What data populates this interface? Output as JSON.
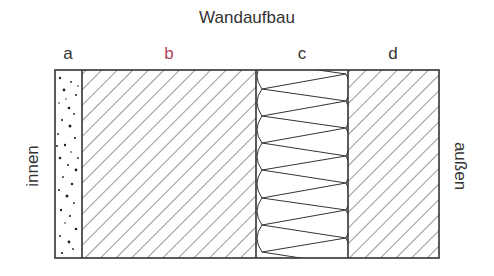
{
  "diagram": {
    "title": "Wandaufbau",
    "layers": [
      {
        "id": "a",
        "label": "a",
        "pattern": "stipple",
        "color": "#333333"
      },
      {
        "id": "b",
        "label": "b",
        "pattern": "diagonal-hatch",
        "color": "#b0485a"
      },
      {
        "id": "c",
        "label": "c",
        "pattern": "insulation-zigzag",
        "color": "#333333"
      },
      {
        "id": "d",
        "label": "d",
        "pattern": "diagonal-hatch",
        "color": "#333333"
      }
    ],
    "side_left": "innen",
    "side_right": "außen"
  }
}
